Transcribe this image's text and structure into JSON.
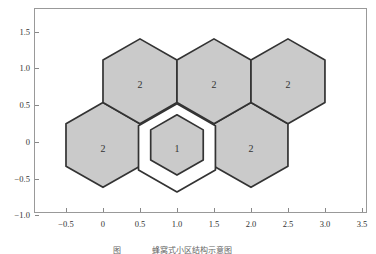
{
  "figure": {
    "caption": {
      "figure_label": "图",
      "title": "蜂窝式小区结构示意图"
    }
  },
  "chart_data": {
    "type": "hexagon-cell-diagram",
    "title": "",
    "xlabel": "",
    "ylabel": "",
    "grid": false,
    "legend": null,
    "xlim": [
      -0.932,
      3.568
    ],
    "ylim": [
      -0.966,
      1.823
    ],
    "x_tick_labels": [
      "−0.5",
      "0",
      "0.5",
      "1.0",
      "1.5",
      "2.0",
      "2.5",
      "3.0",
      "3.5"
    ],
    "x_tick_values": [
      -0.5,
      0,
      0.5,
      1.0,
      1.5,
      2.0,
      2.5,
      3.0,
      3.5
    ],
    "y_tick_labels": [
      "−1.0",
      "−0.5",
      "0",
      "0.5",
      "1.0",
      "1.5"
    ],
    "y_tick_values": [
      -1.0,
      -0.5,
      0,
      0.5,
      1.0,
      1.5
    ],
    "cells": [
      {
        "cx": 0.0,
        "cy": 0.0,
        "label": "2"
      },
      {
        "cx": 2.0,
        "cy": 0.0,
        "label": "2"
      },
      {
        "cx": 0.5,
        "cy": 0.866,
        "label": "2"
      },
      {
        "cx": 1.5,
        "cy": 0.866,
        "label": "2"
      },
      {
        "cx": 2.5,
        "cy": 0.866,
        "label": "2"
      }
    ],
    "cell_radius": 0.577,
    "cell_y_offset": -0.04,
    "label_dy": -0.05,
    "ring_cell": {
      "cx": 1.0,
      "cy": -0.08,
      "radius": 0.6
    },
    "center_cell": {
      "cx": 1.0,
      "cy": -0.04,
      "radius": 0.41,
      "label": "1"
    },
    "colors": {
      "cell_fill": "#cacaca",
      "cell_stroke": "#333333",
      "ring_fill": "#ffffff",
      "spine": "#999999",
      "tick": "#888888",
      "tick_text": "#333333",
      "cell_text": "#333333",
      "caption_text": "#666666"
    }
  }
}
